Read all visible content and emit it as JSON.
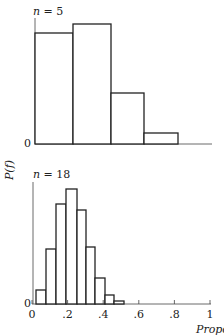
{
  "chart_data": [
    {
      "type": "bar",
      "title": "n = 5",
      "xlabel": "Proportion",
      "ylabel": "P(f)",
      "bin_width": 0.2,
      "categories": [
        "0-0.2",
        "0.2-0.4",
        "0.4-0.6",
        "0.6-0.8"
      ],
      "bin_edges": [
        0,
        0.2,
        0.4,
        0.6,
        0.8
      ],
      "values": [
        111,
        120,
        51,
        11
      ],
      "values_note": "relative heights (pixels), y-axis unlabelled except 0",
      "ylim": [
        0,
        125
      ],
      "yticks": [
        "0"
      ],
      "grid": false
    },
    {
      "type": "bar",
      "title": "n = 18",
      "xlabel": "Proportion",
      "ylabel": "P(f)",
      "bin_width": 0.055,
      "categories": [
        "0.00",
        "0.055",
        "0.11",
        "0.17",
        "0.22",
        "0.28",
        "0.33",
        "0.39",
        "0.44"
      ],
      "values": [
        14,
        55,
        100,
        115,
        94,
        57,
        26,
        9,
        3
      ],
      "values_note": "relative heights (pixels), y-axis unlabelled except 0",
      "xlim": [
        0,
        1
      ],
      "xticks": [
        "0",
        ".2",
        ".4",
        ".6",
        ".8",
        "1"
      ],
      "yticks": [
        "0"
      ],
      "grid": false
    }
  ],
  "labels": {
    "top_n": "n = 5",
    "bottom_n": "n = 18",
    "ylabel": "P(f)",
    "xlabel": "Proportion",
    "zero": "0",
    "xticks": [
      "0",
      ".2",
      ".4",
      ".6",
      ".8",
      "1"
    ]
  }
}
